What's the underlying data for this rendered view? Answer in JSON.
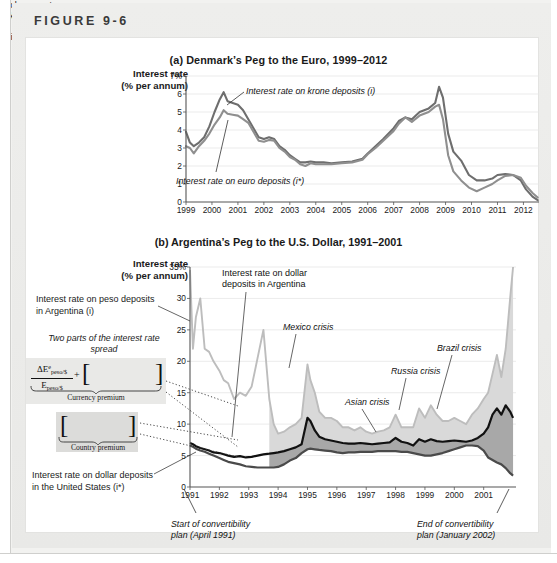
{
  "figure": {
    "label": "FIGURE 9-6"
  },
  "panel_a": {
    "title": "(a) Denmark’s Peg to the Euro, 1999–2012",
    "axis_label_line1": "Interest rate",
    "axis_label_line2": "(% per annum)",
    "note_krone": "Interest rate on krone deposits (i)",
    "note_euro": "Interest rate on euro deposits (i*)"
  },
  "panel_b": {
    "title": "(b) Argentina’s Peg to the U.S. Dollar, 1991–2001",
    "axis_label_line1": "Interest rate",
    "axis_label_line2": "(% per annum)",
    "ann_peso": "Interest rate on peso deposits in Argentina (i)",
    "ann_twoparts": "Two parts of the interest rate spread",
    "ann_us": "Interest rate on dollar deposits in the United States (i*)",
    "formula": {
      "numerator": "ΔE",
      "numerator_sup": "e",
      "numerator_sub": "peso/$",
      "denominator": "E",
      "denominator_sub": "peso/$",
      "plus": "+",
      "bracket_left": "[",
      "bracket_right": "]",
      "exchange_line1": "Exchange rate",
      "exchange_line2": "risk premium",
      "currency_label": "Currency premium",
      "default_line1": "Default",
      "default_line2": "risk premium",
      "country_label": "Country premium"
    },
    "note_dollar_line1": "Interest rate on dollar",
    "note_dollar_line2": "deposits in Argentina",
    "note_mexico": "Mexico crisis",
    "note_asian": "Asian crisis",
    "note_russia": "Russia crisis",
    "note_brazil": "Brazil crisis",
    "conv_start_line1": "Start of convertibility",
    "conv_start_line2": "plan (April 1991)",
    "conv_end_line1": "End of convertibility",
    "conv_end_line2": "plan (January 2002)"
  },
  "colors": {
    "krone_line": "#6e6e6e",
    "euro_line": "#8f8f8f",
    "peso_line": "#bdbdbd",
    "dollar_arg_line": "#111111",
    "us_line": "#4a4a4a",
    "currency_fill": "#d9d9d9",
    "country_fill": "#a8a8a8",
    "grid": "#e6e6e6",
    "axis": "#555555"
  },
  "chart_data": [
    {
      "type": "line",
      "id": "panel-a",
      "title": "(a) Denmark’s Peg to the Euro, 1999–2012",
      "xlabel": "",
      "ylabel": "Interest rate (% per annum)",
      "ylim": [
        0,
        7
      ],
      "yticks": [
        0,
        1,
        2,
        3,
        4,
        5,
        6,
        7
      ],
      "ytick_labels": [
        "0",
        "1",
        "2",
        "3",
        "4",
        "5",
        "6",
        "7%"
      ],
      "xlim": [
        1999,
        2012.6
      ],
      "xticks": [
        1999,
        2000,
        2001,
        2002,
        2003,
        2004,
        2005,
        2006,
        2007,
        2008,
        2009,
        2010,
        2011,
        2012
      ],
      "xtick_labels": [
        "1999",
        "2000",
        "2001",
        "2002",
        "2003",
        "2004",
        "2005",
        "2006",
        "2007",
        "2008",
        "2009",
        "2010",
        "2011",
        "2012"
      ],
      "grid": true,
      "legend": "annotations",
      "series": [
        {
          "name": "Interest rate on krone deposits (i)",
          "color": "#6e6e6e",
          "x": [
            1999.0,
            1999.15,
            1999.3,
            1999.5,
            1999.7,
            1999.9,
            2000.1,
            2000.3,
            2000.45,
            2000.6,
            2000.8,
            2001.0,
            2001.2,
            2001.4,
            2001.6,
            2001.8,
            2002.0,
            2002.2,
            2002.4,
            2002.6,
            2002.8,
            2003.0,
            2003.2,
            2003.4,
            2003.6,
            2003.8,
            2004.0,
            2004.3,
            2004.6,
            2005.0,
            2005.4,
            2005.8,
            2006.0,
            2006.3,
            2006.6,
            2007.0,
            2007.2,
            2007.45,
            2007.7,
            2008.0,
            2008.35,
            2008.6,
            2008.75,
            2008.9,
            2009.1,
            2009.3,
            2009.6,
            2009.9,
            2010.2,
            2010.5,
            2010.8,
            2011.0,
            2011.3,
            2011.6,
            2011.9,
            2012.1,
            2012.35,
            2012.55
          ],
          "y": [
            3.9,
            3.3,
            3.1,
            3.3,
            3.6,
            4.2,
            5.0,
            5.7,
            6.1,
            5.6,
            5.5,
            5.4,
            5.1,
            4.6,
            4.1,
            3.6,
            3.5,
            3.6,
            3.5,
            3.1,
            2.9,
            2.6,
            2.4,
            2.2,
            2.2,
            2.25,
            2.2,
            2.2,
            2.15,
            2.2,
            2.25,
            2.4,
            2.7,
            3.1,
            3.5,
            4.1,
            4.5,
            4.7,
            4.6,
            5.0,
            5.2,
            5.5,
            6.4,
            5.8,
            3.8,
            2.8,
            2.3,
            1.5,
            1.2,
            1.2,
            1.3,
            1.5,
            1.55,
            1.5,
            1.2,
            0.7,
            0.3,
            0.1
          ]
        },
        {
          "name": "Interest rate on euro deposits (i*)",
          "color": "#8f8f8f",
          "x": [
            1999.0,
            1999.15,
            1999.3,
            1999.5,
            1999.7,
            1999.9,
            2000.1,
            2000.3,
            2000.45,
            2000.6,
            2000.8,
            2001.0,
            2001.2,
            2001.4,
            2001.6,
            2001.8,
            2002.0,
            2002.2,
            2002.4,
            2002.6,
            2002.8,
            2003.0,
            2003.2,
            2003.4,
            2003.6,
            2003.8,
            2004.0,
            2004.3,
            2004.6,
            2005.0,
            2005.4,
            2005.8,
            2006.0,
            2006.3,
            2006.6,
            2007.0,
            2007.2,
            2007.45,
            2007.7,
            2008.0,
            2008.35,
            2008.6,
            2008.75,
            2008.9,
            2009.1,
            2009.3,
            2009.6,
            2009.9,
            2010.2,
            2010.5,
            2010.8,
            2011.0,
            2011.3,
            2011.6,
            2011.9,
            2012.1,
            2012.35,
            2012.55
          ],
          "y": [
            3.1,
            3.0,
            2.7,
            3.1,
            3.4,
            3.8,
            4.3,
            4.7,
            5.1,
            4.9,
            4.85,
            4.8,
            4.6,
            4.4,
            3.9,
            3.4,
            3.35,
            3.45,
            3.4,
            3.0,
            2.8,
            2.5,
            2.35,
            2.1,
            2.0,
            2.15,
            2.1,
            2.1,
            2.1,
            2.15,
            2.2,
            2.35,
            2.65,
            3.0,
            3.4,
            3.95,
            4.35,
            4.7,
            4.45,
            4.8,
            5.0,
            5.3,
            5.4,
            4.6,
            2.6,
            1.7,
            1.2,
            0.8,
            0.6,
            0.8,
            1.0,
            1.2,
            1.45,
            1.5,
            1.35,
            0.9,
            0.5,
            0.25
          ]
        }
      ]
    },
    {
      "type": "area",
      "id": "panel-b",
      "title": "(b) Argentina’s Peg to the U.S. Dollar, 1991–2001",
      "xlabel": "",
      "ylabel": "Interest rate (% per annum)",
      "ylim": [
        0,
        35
      ],
      "yticks": [
        0,
        5,
        10,
        15,
        20,
        25,
        30,
        35
      ],
      "ytick_labels": [
        "0",
        "5",
        "10",
        "15",
        "20",
        "25",
        "30",
        "35%"
      ],
      "xlim": [
        1991,
        2002.1
      ],
      "xticks": [
        1991,
        1992,
        1993,
        1994,
        1995,
        1996,
        1997,
        1998,
        1999,
        2000,
        2001
      ],
      "xtick_labels": [
        "1991",
        "1992",
        "1993",
        "1994",
        "1995",
        "1996",
        "1997",
        "1998",
        "1999",
        "2000",
        "2001"
      ],
      "grid": true,
      "annotations": [
        {
          "text": "Mexico crisis",
          "x": 1995.0
        },
        {
          "text": "Asian crisis",
          "x": 1997.8
        },
        {
          "text": "Russia crisis",
          "x": 1998.7
        },
        {
          "text": "Brazil crisis",
          "x": 1999.2
        },
        {
          "text": "Start of convertibility plan (April 1991)",
          "x": 1991.3
        },
        {
          "text": "End of convertibility plan (January 2002)",
          "x": 2002.0
        }
      ],
      "series": [
        {
          "name": "Interest rate on peso deposits in Argentina (i)",
          "color": "#bdbdbd",
          "x": [
            1991.0,
            1991.1,
            1991.2,
            1991.35,
            1991.5,
            1991.65,
            1991.8,
            1992.0,
            1992.15,
            1992.3,
            1992.5,
            1992.7,
            1992.9,
            1993.1,
            1993.3,
            1993.5,
            1993.7,
            1993.85,
            1994.0,
            1994.2,
            1994.4,
            1994.6,
            1994.8,
            1995.0,
            1995.1,
            1995.25,
            1995.4,
            1995.6,
            1995.8,
            1996.0,
            1996.2,
            1996.4,
            1996.6,
            1996.8,
            1997.0,
            1997.2,
            1997.4,
            1997.6,
            1997.8,
            1998.0,
            1998.2,
            1998.4,
            1998.6,
            1998.8,
            1999.0,
            1999.2,
            1999.4,
            1999.6,
            1999.8,
            2000.0,
            2000.2,
            2000.4,
            2000.6,
            2000.8,
            2001.0,
            2001.15,
            2001.3,
            2001.45,
            2001.6,
            2001.75,
            2001.9,
            2002.0
          ],
          "y": [
            34.5,
            22.0,
            27.0,
            30.0,
            22.0,
            21.5,
            20.0,
            18.5,
            17.0,
            16.5,
            14.0,
            15.0,
            14.5,
            16.0,
            20.5,
            25.0,
            14.0,
            10.0,
            8.5,
            8.8,
            9.5,
            10.0,
            11.0,
            19.5,
            17.0,
            15.0,
            12.0,
            11.0,
            11.0,
            10.5,
            9.5,
            9.5,
            9.0,
            9.5,
            8.8,
            8.5,
            8.8,
            9.0,
            9.5,
            11.5,
            9.5,
            9.5,
            9.5,
            12.5,
            11.0,
            13.0,
            11.5,
            10.5,
            10.5,
            11.0,
            10.5,
            10.0,
            11.5,
            12.5,
            14.0,
            15.0,
            18.0,
            21.0,
            17.5,
            22.0,
            30.0,
            35.0
          ]
        },
        {
          "name": "Interest rate on dollar deposits in Argentina",
          "color": "#111111",
          "x": [
            1991.0,
            1991.1,
            1991.2,
            1991.35,
            1991.5,
            1991.65,
            1991.8,
            1992.0,
            1992.15,
            1992.3,
            1992.5,
            1992.7,
            1992.9,
            1993.1,
            1993.3,
            1993.5,
            1993.7,
            1993.85,
            1994.0,
            1994.2,
            1994.4,
            1994.6,
            1994.8,
            1995.0,
            1995.1,
            1995.25,
            1995.4,
            1995.6,
            1995.8,
            1996.0,
            1996.2,
            1996.4,
            1996.6,
            1996.8,
            1997.0,
            1997.2,
            1997.4,
            1997.6,
            1997.8,
            1998.0,
            1998.2,
            1998.4,
            1998.6,
            1998.8,
            1999.0,
            1999.2,
            1999.4,
            1999.6,
            1999.8,
            2000.0,
            2000.2,
            2000.4,
            2000.6,
            2000.8,
            2001.0,
            2001.15,
            2001.3,
            2001.45,
            2001.6,
            2001.75,
            2001.9,
            2002.0
          ],
          "y": [
            7.0,
            6.8,
            6.5,
            6.2,
            6.0,
            5.8,
            5.5,
            5.4,
            5.2,
            5.0,
            4.8,
            4.9,
            4.7,
            4.8,
            5.0,
            5.2,
            5.3,
            5.4,
            5.5,
            5.7,
            6.0,
            6.3,
            6.8,
            11.0,
            10.5,
            9.0,
            8.0,
            7.6,
            7.4,
            7.2,
            7.0,
            6.9,
            6.9,
            7.0,
            6.9,
            6.8,
            6.9,
            7.0,
            7.1,
            7.8,
            7.2,
            7.0,
            6.6,
            7.6,
            7.2,
            7.6,
            7.3,
            7.2,
            7.3,
            7.4,
            7.3,
            7.2,
            7.4,
            7.8,
            8.5,
            9.5,
            11.5,
            12.5,
            11.5,
            13.0,
            12.0,
            11.0
          ]
        },
        {
          "name": "Interest rate on dollar deposits in the United States (i*)",
          "color": "#4a4a4a",
          "x": [
            1991.0,
            1991.1,
            1991.2,
            1991.35,
            1991.5,
            1991.65,
            1991.8,
            1992.0,
            1992.15,
            1992.3,
            1992.5,
            1992.7,
            1992.9,
            1993.1,
            1993.3,
            1993.5,
            1993.7,
            1993.85,
            1994.0,
            1994.2,
            1994.4,
            1994.6,
            1994.8,
            1995.0,
            1995.1,
            1995.25,
            1995.4,
            1995.6,
            1995.8,
            1996.0,
            1996.2,
            1996.4,
            1996.6,
            1996.8,
            1997.0,
            1997.2,
            1997.4,
            1997.6,
            1997.8,
            1998.0,
            1998.2,
            1998.4,
            1998.6,
            1998.8,
            1999.0,
            1999.2,
            1999.4,
            1999.6,
            1999.8,
            2000.0,
            2000.2,
            2000.4,
            2000.6,
            2000.8,
            2001.0,
            2001.15,
            2001.3,
            2001.45,
            2001.6,
            2001.75,
            2001.9,
            2002.0
          ],
          "y": [
            6.6,
            6.4,
            6.1,
            5.8,
            5.6,
            5.3,
            5.0,
            4.6,
            4.3,
            4.0,
            3.8,
            3.6,
            3.3,
            3.2,
            3.1,
            3.1,
            3.1,
            3.1,
            3.2,
            3.6,
            4.2,
            4.6,
            5.4,
            6.0,
            6.1,
            6.0,
            5.9,
            5.8,
            5.7,
            5.5,
            5.4,
            5.5,
            5.5,
            5.6,
            5.6,
            5.6,
            5.7,
            5.7,
            5.7,
            5.7,
            5.6,
            5.6,
            5.4,
            5.2,
            5.0,
            5.0,
            5.2,
            5.4,
            5.7,
            6.0,
            6.3,
            6.6,
            6.6,
            6.5,
            5.8,
            4.7,
            4.3,
            3.9,
            3.6,
            3.0,
            2.2,
            1.8
          ]
        }
      ]
    }
  ]
}
